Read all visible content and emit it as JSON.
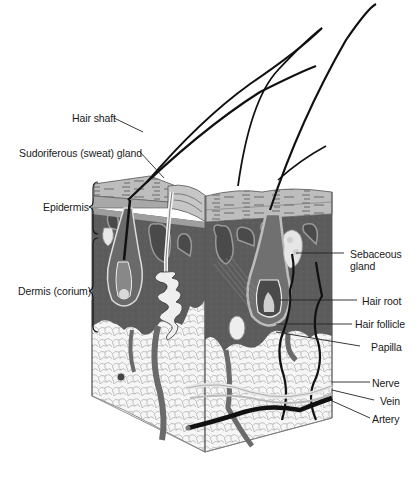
{
  "diagram": {
    "labels_left": [
      {
        "id": "hair-shaft",
        "text": "Hair shaft"
      },
      {
        "id": "sudoriferous-gland",
        "text": "Sudoriferous (sweat) gland"
      },
      {
        "id": "epidermis",
        "text": "Epidermis"
      },
      {
        "id": "dermis",
        "text": "Dermis (corium)"
      }
    ],
    "labels_right": [
      {
        "id": "sebaceous-gland",
        "text": "Sebaceous gland",
        "lines": [
          "Sebaceous",
          "gland"
        ]
      },
      {
        "id": "hair-root",
        "text": "Hair root"
      },
      {
        "id": "hair-follicle",
        "text": "Hair follicle"
      },
      {
        "id": "papilla",
        "text": "Papilla"
      },
      {
        "id": "nerve",
        "text": "Nerve"
      },
      {
        "id": "vein",
        "text": "Vein"
      },
      {
        "id": "artery",
        "text": "Artery"
      }
    ],
    "colors": {
      "dermis": "#5a5a5a",
      "epidermis": "#b8b8b8",
      "subcutaneous": "#f4f4f4",
      "ink": "#111111",
      "background": "#ffffff"
    }
  }
}
